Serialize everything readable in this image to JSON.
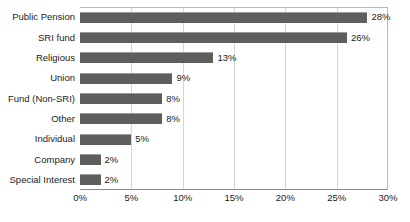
{
  "chart_data": {
    "type": "bar",
    "orientation": "horizontal",
    "title": "",
    "subtitle": "",
    "xlabel": "",
    "ylabel": "",
    "categories": [
      "Public Pension",
      "SRI fund",
      "Religious",
      "Union",
      "Fund (Non-SRI)",
      "Other",
      "Individual",
      "Company",
      "Special Interest"
    ],
    "values": [
      28,
      26,
      13,
      9,
      8,
      8,
      5,
      2,
      2
    ],
    "data_labels": [
      "28%",
      "26%",
      "13%",
      "9%",
      "8%",
      "8%",
      "5%",
      "2%",
      "2%"
    ],
    "xlim": [
      0,
      30
    ],
    "xticks": [
      0,
      5,
      10,
      15,
      20,
      25,
      30
    ],
    "xtick_labels": [
      "0%",
      "5%",
      "10%",
      "15%",
      "20%",
      "25%",
      "30%"
    ],
    "grid": true,
    "grid_axis": "x",
    "legend": false,
    "legend_position": "none",
    "bar_color": "#5e5e5e",
    "grid_color": "#d6d6d6",
    "axis_color": "#8c8c8c",
    "text_color": "#1b1b1b",
    "background": "#ffffff"
  }
}
